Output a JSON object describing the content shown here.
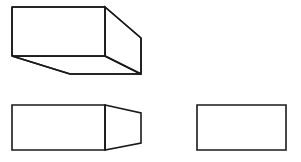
{
  "page": {
    "background_color": "#ffffff",
    "stroke_color": "#1a1a1a",
    "fill_color": "#ffffff",
    "stroke_width": 1.6,
    "width": 301,
    "height": 162
  },
  "figures": [
    {
      "id": "figure-1",
      "name": "three-dimensional-box-wireframe",
      "description": "Rectangular box drawn in oblique projection, viewed from below-left",
      "faces": {
        "front_face": {
          "name": "front-face",
          "points": "12,7 105,7 105,56 12,56"
        },
        "top_right_face": {
          "name": "right-side-face",
          "points": "105,7 141,38 141,74 105,56"
        },
        "bottom_face": {
          "name": "bottom-face",
          "points": "12,56 105,56 141,74 70,74"
        }
      },
      "edges": [
        {
          "name": "front-top-edge",
          "points": "12,7 105,7"
        },
        {
          "name": "front-left-edge",
          "points": "12,7 12,56"
        },
        {
          "name": "front-bottom-edge",
          "points": "12,56 105,56"
        },
        {
          "name": "front-right-edge",
          "points": "105,7 105,56"
        },
        {
          "name": "top-receding-edge",
          "points": "105,7 141,38"
        },
        {
          "name": "rear-vertical-edge",
          "points": "141,38 141,74"
        },
        {
          "name": "bottom-receding-edge",
          "points": "105,56 141,74"
        },
        {
          "name": "bottom-left-receding-edge",
          "points": "12,56 70,74"
        },
        {
          "name": "bottom-rear-edge",
          "points": "70,74 141,74"
        }
      ]
    },
    {
      "id": "figure-2",
      "name": "rectangle-with-tapered-end",
      "description": "Rectangle joined to a trapezoid whose far side is shorter",
      "parts": {
        "rectangle": {
          "name": "rectangle-body",
          "points": "12,105 105,105 105,150 12,150"
        },
        "trapezoid": {
          "name": "tapered-end",
          "points": "105,105 141,113 141,143 105,150"
        },
        "divider": {
          "name": "dividing-edge",
          "points": "105,105 105,150"
        }
      }
    },
    {
      "id": "figure-3",
      "name": "plain-rectangle",
      "description": "Simple empty rectangle",
      "parts": {
        "rectangle": {
          "name": "rectangle-outline",
          "points": "197,105 286,105 286,150 197,150"
        }
      }
    }
  ]
}
